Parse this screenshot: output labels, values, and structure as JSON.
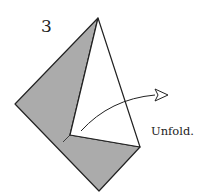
{
  "step_number": "3",
  "caption": "Unfold.",
  "colors": {
    "shaded_paper": "#ababab",
    "outline": "#222222",
    "white_paper": "#ffffff"
  },
  "shapes": {
    "top_point": [
      98,
      18
    ],
    "left_point": [
      15,
      104
    ],
    "bottom_point": [
      99,
      191
    ],
    "right_point": [
      140,
      147
    ],
    "inner_corner": [
      70,
      135
    ]
  },
  "arrow": {
    "type": "curved-unfold-arrow",
    "start": [
      81,
      131
    ],
    "end": [
      165,
      95
    ]
  }
}
